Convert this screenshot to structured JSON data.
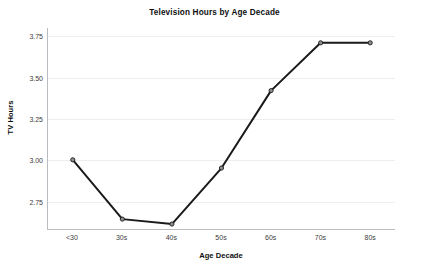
{
  "chart_data": {
    "type": "line",
    "title": "Television Hours by Age Decade",
    "xlabel": "Age Decade",
    "ylabel": "TV Hours",
    "categories": [
      "<30",
      "30s",
      "40s",
      "50s",
      "60s",
      "70s",
      "80s"
    ],
    "values": [
      3.0,
      2.64,
      2.61,
      2.95,
      3.42,
      3.71,
      3.71
    ],
    "series": [
      {
        "name": "TV Hours",
        "values": [
          3.0,
          2.64,
          2.61,
          2.95,
          3.42,
          3.71,
          3.71
        ]
      }
    ],
    "yticks": [
      "2.75",
      "3.00",
      "3.25",
      "3.50",
      "3.75"
    ],
    "ytick_values": [
      2.75,
      3.0,
      3.25,
      3.5,
      3.75
    ],
    "ylim": [
      2.58,
      3.8
    ],
    "xlim": [
      -0.5,
      6.5
    ],
    "grid": "horizontal",
    "legend": "none",
    "line_color": "#1a1a1a",
    "marker_face_color": "#8c8c8c",
    "marker_edge_color": "#1a1a1a",
    "grid_color": "#eceef0",
    "axis_color": "#b9bcc0",
    "background_color": "#ffffff"
  }
}
